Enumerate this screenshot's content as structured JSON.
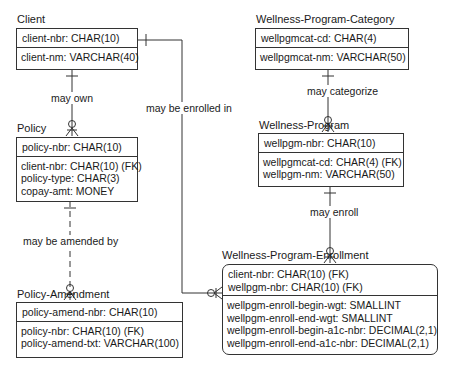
{
  "entities": {
    "client": {
      "title": "Client",
      "keys": [
        "client-nbr: CHAR(10)"
      ],
      "attributes": [
        "client-nm: VARCHAR(40)"
      ]
    },
    "policy": {
      "title": "Policy",
      "keys": [
        "policy-nbr: CHAR(10)"
      ],
      "attributes": [
        "client-nbr: CHAR(10) (FK)",
        "policy-type: CHAR(3)",
        "copay-amt: MONEY"
      ]
    },
    "policy_amendment": {
      "title": "Policy-Amendment",
      "keys": [
        "policy-amend-nbr: CHAR(10)"
      ],
      "attributes": [
        "policy-nbr: CHAR(10) (FK)",
        "policy-amend-txt: VARCHAR(100)"
      ]
    },
    "wellness_program_category": {
      "title": "Wellness-Program-Category",
      "keys": [
        "wellpgmcat-cd: CHAR(4)"
      ],
      "attributes": [
        "wellpgmcat-nm: VARCHAR(50)"
      ]
    },
    "wellness_program": {
      "title": "Wellness-Program",
      "keys": [
        "wellpgm-nbr: CHAR(10)"
      ],
      "attributes": [
        "wellpgmcat-cd: CHAR(4) (FK)",
        "wellpgm-nm: VARCHAR(50)"
      ]
    },
    "wellness_program_enrollment": {
      "title": "Wellness-Program-Enrollment",
      "keys": [
        "client-nbr: CHAR(10) (FK)",
        "wellpgm-nbr: CHAR(10) (FK)"
      ],
      "attributes": [
        "wellpgm-enroll-begin-wgt: SMALLINT",
        "wellpgm-enroll-end-wgt: SMALLINT",
        "wellpgm-enroll-begin-a1c-nbr: DECIMAL(2,1)",
        "wellpgm-enroll-end-a1c-nbr: DECIMAL(2,1)"
      ]
    }
  },
  "relationships": {
    "client_policy": "may own",
    "policy_amendment": "may be amended by",
    "client_enrollment": "may be enrolled in",
    "category_program": "may categorize",
    "program_enrollment": "may enroll"
  },
  "colors": {
    "line": "#333333",
    "background": "#ffffff"
  }
}
